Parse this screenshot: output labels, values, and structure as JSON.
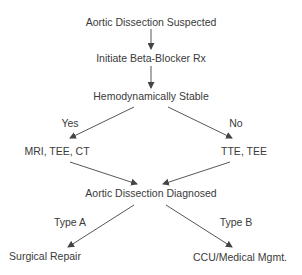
{
  "diagram": {
    "type": "flowchart",
    "nodes": {
      "suspected": "Aortic Dissection Suspected",
      "beta_blocker": "Initiate Beta-Blocker Rx",
      "stable": "Hemodynamically Stable",
      "mri": "MRI, TEE, CT",
      "tte": "TTE, TEE",
      "diagnosed": "Aortic Dissection Diagnosed",
      "surgical": "Surgical Repair",
      "ccu": "CCU/Medical Mgmt."
    },
    "edge_labels": {
      "yes": "Yes",
      "no": "No",
      "type_a": "Type A",
      "type_b": "Type B"
    },
    "edges": [
      {
        "from": "suspected",
        "to": "beta_blocker",
        "label": ""
      },
      {
        "from": "beta_blocker",
        "to": "stable",
        "label": ""
      },
      {
        "from": "stable",
        "to": "mri",
        "label": "Yes"
      },
      {
        "from": "stable",
        "to": "tte",
        "label": "No"
      },
      {
        "from": "mri",
        "to": "diagnosed",
        "label": ""
      },
      {
        "from": "tte",
        "to": "diagnosed",
        "label": ""
      },
      {
        "from": "diagnosed",
        "to": "surgical",
        "label": "Type A"
      },
      {
        "from": "diagnosed",
        "to": "ccu",
        "label": "Type B"
      }
    ],
    "colors": {
      "text": "#3a3a3a",
      "line": "#444444",
      "background": "#ffffff"
    }
  }
}
